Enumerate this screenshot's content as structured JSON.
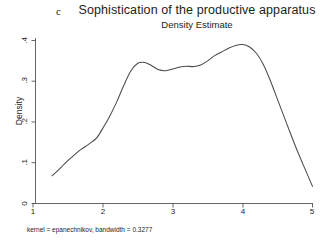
{
  "panel": {
    "letter": "c"
  },
  "header": {
    "title": "Sophistication of the productive apparatus",
    "subtitle": "Density Estimate"
  },
  "caption": "kernel = epanechnikov, bandwidth = 0.3277",
  "axes": {
    "ylabel": "Density",
    "yticks": [
      ".4",
      ".3",
      ".2",
      ".1",
      "0"
    ],
    "xticks": [
      "1",
      "2",
      "3",
      "4",
      "5"
    ]
  },
  "chart_data": {
    "type": "line",
    "title": "Sophistication of the productive apparatus",
    "subtitle": "Density Estimate",
    "panel_label": "c",
    "xlabel": "",
    "ylabel": "Density",
    "xlim": [
      1.0,
      5.0
    ],
    "ylim": [
      0.0,
      0.4
    ],
    "xticks": [
      1,
      2,
      3,
      4,
      5
    ],
    "yticks": [
      0,
      0.1,
      0.2,
      0.3,
      0.4
    ],
    "grid": false,
    "legend": null,
    "annotation": "kernel = epanechnikov, bandwidth = 0.3277",
    "kernel": "epanechnikov",
    "bandwidth": 0.3277,
    "series": [
      {
        "name": "Density Estimate",
        "color": "#4a4a4a",
        "x": [
          1.27,
          1.35,
          1.45,
          1.55,
          1.65,
          1.75,
          1.85,
          1.92,
          2.0,
          2.1,
          2.2,
          2.3,
          2.4,
          2.5,
          2.6,
          2.7,
          2.8,
          2.9,
          3.0,
          3.1,
          3.2,
          3.3,
          3.4,
          3.5,
          3.6,
          3.7,
          3.8,
          3.9,
          4.0,
          4.1,
          4.2,
          4.3,
          4.4,
          4.5,
          4.6,
          4.7,
          4.8,
          4.9,
          5.0
        ],
        "y": [
          0.068,
          0.08,
          0.097,
          0.113,
          0.128,
          0.14,
          0.152,
          0.163,
          0.185,
          0.215,
          0.25,
          0.29,
          0.325,
          0.344,
          0.346,
          0.338,
          0.328,
          0.326,
          0.33,
          0.335,
          0.337,
          0.336,
          0.34,
          0.35,
          0.363,
          0.372,
          0.381,
          0.388,
          0.39,
          0.384,
          0.368,
          0.34,
          0.3,
          0.255,
          0.21,
          0.165,
          0.122,
          0.082,
          0.042
        ]
      }
    ]
  }
}
